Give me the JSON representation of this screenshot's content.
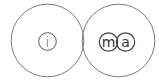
{
  "logo": {
    "letters": {
      "left": "i",
      "right_first": "m",
      "right_second": "a"
    },
    "colors": {
      "background": "#ffffff",
      "outer_stroke": "#7a7a7a",
      "inner_stroke": "#444444",
      "text": "#333333"
    }
  }
}
